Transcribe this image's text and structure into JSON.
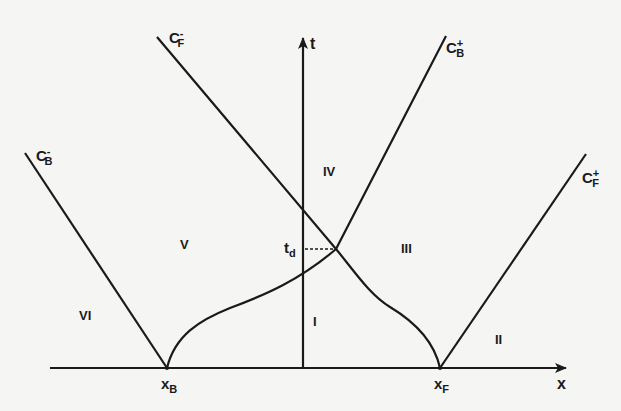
{
  "diagram": {
    "type": "characteristics x-t diagram",
    "axes": {
      "x_label": "x",
      "t_label": "t"
    },
    "points": {
      "xB": {
        "base": "x",
        "sub": "B"
      },
      "xF": {
        "base": "x",
        "sub": "F"
      },
      "td": {
        "base": "t",
        "sub": "d"
      }
    },
    "characteristics": {
      "CB_minus": {
        "base": "C",
        "sub": "B",
        "sup": "-"
      },
      "CF_minus": {
        "base": "C",
        "sub": "F",
        "sup": "-"
      },
      "CB_plus": {
        "base": "C",
        "sub": "B",
        "sup": "+"
      },
      "CF_plus": {
        "base": "C",
        "sub": "F",
        "sup": "+"
      }
    },
    "regions": [
      "I",
      "II",
      "III",
      "IV",
      "V",
      "VI"
    ],
    "colors": {
      "line": "#1a1a1a",
      "background": "#f5f5f3"
    }
  }
}
